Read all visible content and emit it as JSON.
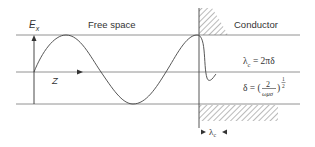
{
  "diagram": {
    "labels": {
      "field_axis": "E",
      "field_axis_subscript": "x",
      "propagation_axis": "Z",
      "region_left": "Free space",
      "region_right": "Conductor"
    },
    "equations": {
      "wavelength_lhs": "λ",
      "wavelength_sub": "c",
      "wavelength_rhs": " = 2πδ",
      "skin_depth_lhs": "δ = (",
      "skin_depth_num": "2",
      "skin_depth_den": "ωμσ",
      "skin_depth_close": ")",
      "skin_depth_exp_num": "1",
      "skin_depth_exp_den": "2"
    },
    "dimension": {
      "symbol": "λ",
      "subscript": "c"
    },
    "colors": {
      "line": "#555555",
      "curve": "#444444",
      "hatch": "#666666",
      "text": "#333333"
    }
  }
}
